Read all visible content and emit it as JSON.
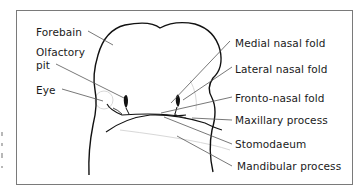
{
  "figure": {
    "left_labels": [
      {
        "id": "forebrain",
        "text": "Forebain"
      },
      {
        "id": "olfactory-pit-1",
        "text": "Olfactory"
      },
      {
        "id": "olfactory-pit-2",
        "text": "pit"
      },
      {
        "id": "eye",
        "text": "Eye"
      }
    ],
    "right_labels": [
      {
        "id": "medial-nasal-fold",
        "text": "Medial nasal fold"
      },
      {
        "id": "lateral-nasal-fold",
        "text": "Lateral nasal fold"
      },
      {
        "id": "fronto-nasal-fold",
        "text": "Fronto-nasal fold"
      },
      {
        "id": "maxillary-process",
        "text": "Maxillary process"
      },
      {
        "id": "stomodaeum",
        "text": "Stomodaeum"
      },
      {
        "id": "mandibular-process",
        "text": "Mandibular process"
      }
    ],
    "colors": {
      "outline": "#111111",
      "leader": "#555555",
      "border": "#7a7a7a",
      "shading": "#d8d8d8"
    }
  }
}
